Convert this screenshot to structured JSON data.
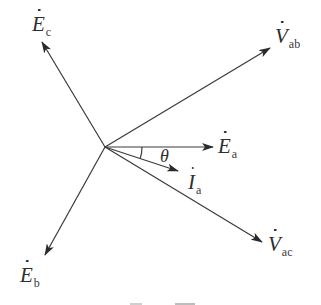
{
  "diagram": {
    "type": "phasor-diagram",
    "origin": {
      "x": 105,
      "y": 147
    },
    "stroke_color": "#3a3a3a",
    "phasors": [
      {
        "id": "Ec",
        "symbol": "E",
        "subscript": "c",
        "tip": {
          "x": 42,
          "y": 42
        }
      },
      {
        "id": "Vab",
        "symbol": "V",
        "subscript": "ab",
        "tip": {
          "x": 270,
          "y": 48
        }
      },
      {
        "id": "Ea",
        "symbol": "E",
        "subscript": "a",
        "tip": {
          "x": 213,
          "y": 147
        }
      },
      {
        "id": "Ia",
        "symbol": "I",
        "subscript": "a",
        "tip": {
          "x": 178,
          "y": 171
        }
      },
      {
        "id": "Vac",
        "symbol": "V",
        "subscript": "ac",
        "tip": {
          "x": 262,
          "y": 242
        }
      },
      {
        "id": "Eb",
        "symbol": "E",
        "subscript": "b",
        "tip": {
          "x": 45,
          "y": 255
        }
      }
    ],
    "labels": {
      "Ec": {
        "symbol": "E",
        "subscript": "c"
      },
      "Vab": {
        "symbol": "V",
        "subscript": "ab"
      },
      "Ea": {
        "symbol": "E",
        "subscript": "a"
      },
      "Ia": {
        "symbol": "I",
        "subscript": "a"
      },
      "Vac": {
        "symbol": "V",
        "subscript": "ac"
      },
      "Eb": {
        "symbol": "E",
        "subscript": "b"
      }
    },
    "angle": {
      "label": "θ",
      "between": [
        "Ea",
        "Ia"
      ]
    }
  }
}
